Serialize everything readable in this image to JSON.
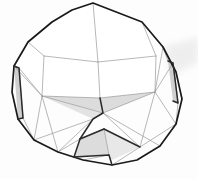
{
  "scene": {
    "title": "3D polyhedron wireframe render",
    "subject": "convex-polyhedron-mesh",
    "canvas": {
      "width": 198,
      "height": 179
    },
    "background_color": "#fdfdfd",
    "shadow_color": "#e6e6e6"
  },
  "style": {
    "silhouette_color": "#1a1a1a",
    "silhouette_width": 1.7,
    "interior_edge_color": "#9a9a9a",
    "interior_edge_width": 0.7,
    "crease_edge_color": "#2a2a2a",
    "crease_edge_width": 1.5,
    "face_fill_light": "#ffffff",
    "face_fill_shaded": "#dcdcdc",
    "face_fill_mid": "#ededed",
    "face_fill_dark": "#cfcfcf"
  },
  "geometry": {
    "silhouette": "M 93,3 L 142,22 L 163,47 L 176,72 L 182,99 L 176,124 L 160,146 L 137,160 L 112,165 L 83,160 L 58,152 L 34,140 L 18,119 L 12,92 L 14,66 L 28,42 L 52,22 L 72,10 Z",
    "silhouette_vertices": [
      {
        "id": "v-top",
        "x": 93,
        "y": 3
      },
      {
        "id": "v-top-right",
        "x": 142,
        "y": 22
      },
      {
        "id": "v-right-upper",
        "x": 163,
        "y": 47
      },
      {
        "id": "v-right",
        "x": 176,
        "y": 72
      },
      {
        "id": "v-right-lower",
        "x": 182,
        "y": 99
      },
      {
        "id": "v-lower-right",
        "x": 176,
        "y": 124
      },
      {
        "id": "v-bottom-right",
        "x": 160,
        "y": 146
      },
      {
        "id": "v-bottom-r2",
        "x": 137,
        "y": 160
      },
      {
        "id": "v-bottom",
        "x": 112,
        "y": 165
      },
      {
        "id": "v-bottom-l2",
        "x": 83,
        "y": 160
      },
      {
        "id": "v-bottom-left",
        "x": 58,
        "y": 152
      },
      {
        "id": "v-lower-left",
        "x": 34,
        "y": 140
      },
      {
        "id": "v-left-lower",
        "x": 18,
        "y": 119
      },
      {
        "id": "v-left",
        "x": 12,
        "y": 92
      },
      {
        "id": "v-left-upper",
        "x": 14,
        "y": 66
      },
      {
        "id": "v-upper-left",
        "x": 28,
        "y": 42
      },
      {
        "id": "v-top-l2",
        "x": 52,
        "y": 22
      },
      {
        "id": "v-top-l1",
        "x": 72,
        "y": 10
      }
    ],
    "faces": [
      {
        "id": "face-top-cap",
        "fill": "#ffffff",
        "path": "M 93,3 L 142,22 L 156,56 L 98,62 L 44,56 L 28,42 L 72,10 Z"
      },
      {
        "id": "face-upper-band-left",
        "fill": "#ffffff",
        "path": "M 28,42 L 44,56 L 42,96 L 14,66 Z"
      },
      {
        "id": "face-upper-band-right",
        "fill": "#ffffff",
        "path": "M 142,22 L 163,47 L 155,92 L 156,56 Z"
      },
      {
        "id": "face-inner-top-left",
        "fill": "#ffffff",
        "path": "M 44,56 L 98,62 L 100,98 L 42,96 Z"
      },
      {
        "id": "face-inner-top-right",
        "fill": "#ffffff",
        "path": "M 98,62 L 156,56 L 155,92 L 100,98 Z"
      },
      {
        "id": "face-shaded-band",
        "fill": "#dcdcdc",
        "path": "M 42,96 L 100,98 L 155,92 L 103,113 Z"
      },
      {
        "id": "face-shaded-wedge",
        "fill": "#e3e3e3",
        "path": "M 42,96 L 103,113 L 93,119 Z"
      },
      {
        "id": "face-left-sliver",
        "fill": "#cfcfcf",
        "path": "M 14,66 L 19,68 L 23,118 L 18,119 Z"
      },
      {
        "id": "face-right-sliver",
        "fill": "#cfcfcf",
        "path": "M 168,61 L 173,63 L 178,103 L 173,101 Z"
      },
      {
        "id": "face-bottom-gusset",
        "fill": "#dcdcdc",
        "path": "M 80,139 L 104,129 L 109,155 L 74,157 Z"
      },
      {
        "id": "face-bottom-gusset-2",
        "fill": "#e8e8e8",
        "path": "M 104,129 L 140,147 L 112,160 L 109,155 Z"
      }
    ],
    "interior_edges": [
      {
        "id": "edge-i01",
        "path": "M 93,3 L 98,62"
      },
      {
        "id": "edge-i02",
        "path": "M 28,42 L 44,56"
      },
      {
        "id": "edge-i03",
        "path": "M 142,22 L 156,56"
      },
      {
        "id": "edge-i04",
        "path": "M 44,56 L 98,62"
      },
      {
        "id": "edge-i05",
        "path": "M 98,62 L 156,56"
      },
      {
        "id": "edge-i06",
        "path": "M 44,56 L 42,96"
      },
      {
        "id": "edge-i07",
        "path": "M 98,62 L 100,98"
      },
      {
        "id": "edge-i08",
        "path": "M 156,56 L 155,92"
      },
      {
        "id": "edge-i09",
        "path": "M 14,66 L 42,96"
      },
      {
        "id": "edge-i10",
        "path": "M 163,47 L 155,92"
      },
      {
        "id": "edge-i11",
        "path": "M 42,96 L 100,98"
      },
      {
        "id": "edge-i12",
        "path": "M 100,98 L 155,92"
      },
      {
        "id": "edge-i13",
        "path": "M 42,96 L 103,113"
      },
      {
        "id": "edge-i14",
        "path": "M 103,113 L 155,92"
      },
      {
        "id": "edge-i15",
        "path": "M 14,66 L 19,68"
      },
      {
        "id": "edge-i16",
        "path": "M 19,68 L 23,118"
      },
      {
        "id": "edge-i17",
        "path": "M 23,118 L 18,119"
      },
      {
        "id": "edge-i18",
        "path": "M 19,68 L 42,96"
      },
      {
        "id": "edge-i19",
        "path": "M 23,118 L 34,140"
      },
      {
        "id": "edge-i20",
        "path": "M 42,96 L 34,140"
      },
      {
        "id": "edge-i21",
        "path": "M 42,96 L 58,152"
      },
      {
        "id": "edge-i22",
        "path": "M 93,119 L 58,152"
      },
      {
        "id": "edge-i23",
        "path": "M 93,119 L 34,140"
      },
      {
        "id": "edge-i24",
        "path": "M 103,113 L 140,147"
      },
      {
        "id": "edge-i25",
        "path": "M 155,92 L 140,147"
      },
      {
        "id": "edge-i26",
        "path": "M 155,92 L 176,124"
      },
      {
        "id": "edge-i27",
        "path": "M 103,113 L 160,146"
      },
      {
        "id": "edge-i28",
        "path": "M 140,147 L 176,124"
      },
      {
        "id": "edge-i29",
        "path": "M 140,147 L 112,165"
      },
      {
        "id": "edge-i30",
        "path": "M 168,61 L 173,63"
      },
      {
        "id": "edge-i31",
        "path": "M 173,63 L 178,103"
      },
      {
        "id": "edge-i32",
        "path": "M 178,103 L 173,101"
      },
      {
        "id": "edge-i33",
        "path": "M 173,63 L 155,92"
      },
      {
        "id": "edge-i34",
        "path": "M 163,47 L 168,61"
      },
      {
        "id": "edge-i35",
        "path": "M 178,103 L 176,124"
      },
      {
        "id": "edge-i36",
        "path": "M 80,139 L 104,129"
      },
      {
        "id": "edge-i37",
        "path": "M 104,129 L 109,155"
      },
      {
        "id": "edge-i38",
        "path": "M 83,160 L 109,155"
      },
      {
        "id": "edge-i39",
        "path": "M 109,155 L 112,165"
      },
      {
        "id": "edge-i40",
        "path": "M 58,152 L 80,139"
      }
    ],
    "crease_edges": [
      {
        "id": "crease-main-vertical",
        "path": "M 100,98 L 103,113 L 93,119 L 80,139 L 74,157"
      },
      {
        "id": "crease-gusset-left",
        "path": "M 80,139 L 104,129"
      },
      {
        "id": "crease-gusset-right",
        "path": "M 104,129 L 140,147"
      },
      {
        "id": "crease-gusset-base",
        "path": "M 74,157 L 109,155 L 112,165"
      },
      {
        "id": "crease-left-fold",
        "path": "M 14,66 L 19,68 L 23,118 L 18,119"
      },
      {
        "id": "crease-right-fold",
        "path": "M 168,61 L 173,63 L 178,103 L 173,101"
      }
    ],
    "shadow": {
      "id": "background-shadow-streak",
      "path": "M 163,47 L 198,37 L 198,62 L 172,76 Z",
      "fill": "#ececec"
    }
  }
}
